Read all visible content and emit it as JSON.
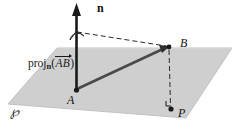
{
  "figure": {
    "background_color": "#ffffff",
    "plane": {
      "name": "P",
      "label": "℘",
      "fill_color": "#cfcfcf",
      "edge_color": "#b8b8b8",
      "corners": "(8,104) (57,48) (232,48) (186,118)"
    },
    "points": [
      {
        "id": "A",
        "label": "A",
        "x": 76,
        "y": 90,
        "role": "vector-tail-on-plane"
      },
      {
        "id": "B",
        "label": "B",
        "x": 168,
        "y": 47,
        "role": "vector-head-above-plane"
      },
      {
        "id": "P",
        "label": "P",
        "x": 170,
        "y": 108,
        "role": "foot-of-perpendicular"
      }
    ],
    "normal_vector": {
      "label": "n",
      "style": "bold-upright",
      "color": "#1a1a1a",
      "from": "(76,90)",
      "to": "(76,6)"
    },
    "vector_ab": {
      "label": "AB",
      "color": "#4d4d4d",
      "from": "(76,90)",
      "to": "(168,47)"
    },
    "projection_label": {
      "word": "proj",
      "subscript": "n",
      "open_paren": "(",
      "vector": "AB",
      "close_paren": ")",
      "full_text": "proj_n(AB→)"
    },
    "dashed_lines": [
      {
        "name": "n-to-B",
        "from": "(76,32)",
        "to": "(168,47)"
      },
      {
        "name": "B-to-P",
        "from": "(168,49)",
        "to": "(170,106)"
      }
    ],
    "angle_markers": [
      {
        "name": "angle-arc-at-n",
        "type": "arc",
        "x": 76,
        "y": 32
      },
      {
        "name": "right-angle-at-P",
        "type": "square",
        "x": 170,
        "y": 104
      }
    ]
  }
}
